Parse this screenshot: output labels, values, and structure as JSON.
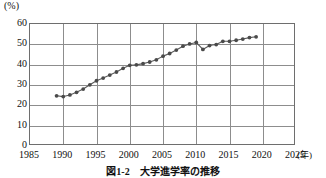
{
  "figure": {
    "caption": "図1-2　大学進学率の推移",
    "y_unit_label": "(%)",
    "x_unit_label": "(年)"
  },
  "chart_data": {
    "type": "line",
    "title": "図1-2　大学進学率の推移",
    "xlabel": "(年)",
    "ylabel": "(%)",
    "xlim": [
      1985,
      2025
    ],
    "ylim": [
      0,
      60
    ],
    "xticks": [
      1985,
      1990,
      1995,
      2000,
      2005,
      2010,
      2015,
      2020,
      2025
    ],
    "yticks": [
      0,
      10,
      20,
      30,
      40,
      50,
      60
    ],
    "grid": true,
    "legend": "none",
    "marker": "circle",
    "line_color": "#5a5a5a",
    "marker_color": "#4a4a4a",
    "x": [
      1989,
      1990,
      1991,
      1992,
      1993,
      1994,
      1995,
      1996,
      1997,
      1998,
      1999,
      2000,
      2001,
      2002,
      2003,
      2004,
      2005,
      2006,
      2007,
      2008,
      2009,
      2010,
      2011,
      2012,
      2013,
      2014,
      2015,
      2016,
      2017,
      2018,
      2019
    ],
    "values": [
      24.7,
      24.3,
      25.1,
      26.4,
      28.0,
      30.1,
      32.1,
      33.4,
      34.9,
      36.4,
      38.2,
      39.7,
      39.9,
      40.5,
      41.3,
      42.4,
      44.2,
      45.5,
      47.2,
      49.1,
      50.2,
      50.9,
      47.5,
      49.4,
      49.9,
      51.5,
      51.5,
      52.0,
      52.6,
      53.3,
      53.7
    ],
    "annotations": []
  },
  "yaxis": {
    "ticks": [
      {
        "label": "60",
        "value": 60
      },
      {
        "label": "50",
        "value": 50
      },
      {
        "label": "40",
        "value": 40
      },
      {
        "label": "30",
        "value": 30
      },
      {
        "label": "20",
        "value": 20
      },
      {
        "label": "10",
        "value": 10
      },
      {
        "label": "0",
        "value": 0
      }
    ]
  },
  "xaxis": {
    "ticks": [
      {
        "label": "1985",
        "value": 1985
      },
      {
        "label": "1990",
        "value": 1990
      },
      {
        "label": "1995",
        "value": 1995
      },
      {
        "label": "2000",
        "value": 2000
      },
      {
        "label": "2005",
        "value": 2005
      },
      {
        "label": "2010",
        "value": 2010
      },
      {
        "label": "2015",
        "value": 2015
      },
      {
        "label": "2020",
        "value": 2020
      },
      {
        "label": "2025",
        "value": 2025
      }
    ]
  }
}
